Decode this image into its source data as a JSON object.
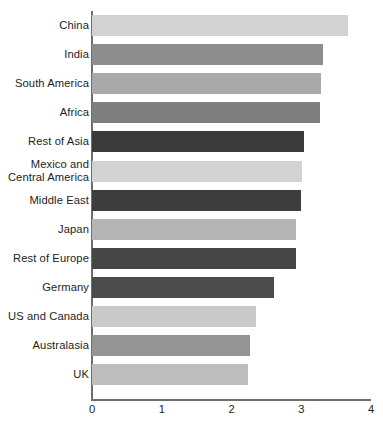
{
  "chart_data": {
    "type": "bar",
    "orientation": "horizontal",
    "title": "",
    "subtitle": "",
    "xlabel": "",
    "ylabel": "",
    "xlim": [
      0,
      4
    ],
    "xticks": [
      0,
      1,
      2,
      3,
      4
    ],
    "xtick_labels": [
      "0",
      "1",
      "2",
      "3",
      "4"
    ],
    "grid": false,
    "legend": false,
    "categories": [
      "China",
      "India",
      "South America",
      "Africa",
      "Rest of Asia",
      "Mexico and\nCentral America",
      "Middle East",
      "Japan",
      "Rest of Europe",
      "Germany",
      "US and Canada",
      "Australasia",
      "UK"
    ],
    "values": [
      3.67,
      3.31,
      3.28,
      3.27,
      3.04,
      3.01,
      3.0,
      2.93,
      2.92,
      2.61,
      2.35,
      2.27,
      2.24
    ],
    "bar_colors": [
      "#d2d2d2",
      "#8d8d8d",
      "#a9a9a9",
      "#7f7f7f",
      "#3b3b3b",
      "#d2d2d2",
      "#3d3d3d",
      "#b5b5b5",
      "#464646",
      "#4b4b4b",
      "#cacaca",
      "#949494",
      "#bdbdbd"
    ],
    "axis_color": "#6e6e6e",
    "background_color": "#ffffff"
  }
}
